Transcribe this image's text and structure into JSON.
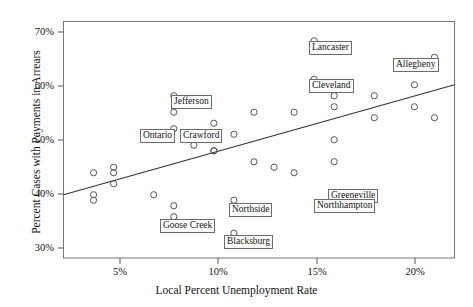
{
  "chart_data": {
    "type": "scatter",
    "title": "",
    "xlabel": "Local Percent Unemployment Rate",
    "ylabel": "Percent Cases with Payments in Arrears",
    "xlim": [
      2.5,
      22.0
    ],
    "ylim": [
      28.5,
      71.5
    ],
    "grid": false,
    "legend": "none",
    "x_ticks": [
      {
        "value": 5,
        "label": "5%"
      },
      {
        "value": 10,
        "label": "10%"
      },
      {
        "value": 15,
        "label": "15%"
      },
      {
        "value": 20,
        "label": "20%"
      }
    ],
    "y_ticks": [
      {
        "value": 30,
        "label": "30%"
      },
      {
        "value": 40,
        "label": "40%"
      },
      {
        "value": 50,
        "label": "50%"
      },
      {
        "value": 60,
        "label": "60%"
      },
      {
        "value": 70,
        "label": "70%"
      }
    ],
    "marker": "open-circle",
    "marker_color": "#555555",
    "points": [
      {
        "x": 4.0,
        "y": 44.0,
        "label": ""
      },
      {
        "x": 4.0,
        "y": 40.0,
        "label": ""
      },
      {
        "x": 4.0,
        "y": 39.0,
        "label": ""
      },
      {
        "x": 5.0,
        "y": 45.0,
        "label": ""
      },
      {
        "x": 5.0,
        "y": 44.0,
        "label": ""
      },
      {
        "x": 5.0,
        "y": 42.0,
        "label": ""
      },
      {
        "x": 7.0,
        "y": 40.0,
        "label": ""
      },
      {
        "x": 8.0,
        "y": 58.0,
        "label": "Jefferson"
      },
      {
        "x": 8.0,
        "y": 55.0,
        "label": ""
      },
      {
        "x": 8.0,
        "y": 52.0,
        "label": "Crawford"
      },
      {
        "x": 8.0,
        "y": 38.0,
        "label": "Goose Creek"
      },
      {
        "x": 8.0,
        "y": 36.0,
        "label": ""
      },
      {
        "x": 9.0,
        "y": 49.0,
        "label": ""
      },
      {
        "x": 10.0,
        "y": 53.0,
        "label": ""
      },
      {
        "x": 10.0,
        "y": 50.0,
        "label": ""
      },
      {
        "x": 10.0,
        "y": 48.0,
        "label": ""
      },
      {
        "x": 10.0,
        "y": 48.0,
        "label": ""
      },
      {
        "x": 11.0,
        "y": 51.0,
        "label": ""
      },
      {
        "x": 11.0,
        "y": 39.0,
        "label": "Northside"
      },
      {
        "x": 11.0,
        "y": 33.0,
        "label": "Blacksburg"
      },
      {
        "x": 12.0,
        "y": 55.0,
        "label": ""
      },
      {
        "x": 12.0,
        "y": 46.0,
        "label": ""
      },
      {
        "x": 13.0,
        "y": 45.0,
        "label": ""
      },
      {
        "x": 14.0,
        "y": 55.0,
        "label": ""
      },
      {
        "x": 14.0,
        "y": 44.0,
        "label": ""
      },
      {
        "x": 15.0,
        "y": 68.0,
        "label": "Lancaster"
      },
      {
        "x": 15.0,
        "y": 61.0,
        "label": "Cleveland"
      },
      {
        "x": 16.0,
        "y": 58.0,
        "label": ""
      },
      {
        "x": 16.0,
        "y": 56.0,
        "label": ""
      },
      {
        "x": 16.0,
        "y": 50.0,
        "label": ""
      },
      {
        "x": 16.0,
        "y": 46.0,
        "label": "Greeneville"
      },
      {
        "x": 16.0,
        "y": 40.0,
        "label": "Northhampton"
      },
      {
        "x": 18.0,
        "y": 58.0,
        "label": ""
      },
      {
        "x": 18.0,
        "y": 54.0,
        "label": ""
      },
      {
        "x": 20.0,
        "y": 60.0,
        "label": ""
      },
      {
        "x": 20.0,
        "y": 56.0,
        "label": ""
      },
      {
        "x": 21.0,
        "y": 65.0,
        "label": "Allegheny"
      },
      {
        "x": 21.0,
        "y": 54.0,
        "label": ""
      }
    ],
    "trend_line": {
      "type": "line",
      "color": "#333333",
      "x_start": 2.5,
      "y_start": 40.0,
      "x_end": 22.0,
      "y_end": 60.0
    },
    "labels": [
      {
        "text": "Lancaster",
        "x": 15.0,
        "y": 68.0
      },
      {
        "text": "Allegheny",
        "x": 21.0,
        "y": 65.0
      },
      {
        "text": "Cleveland",
        "x": 15.0,
        "y": 61.0
      },
      {
        "text": "Jefferson",
        "x": 8.0,
        "y": 58.0
      },
      {
        "text": "Ontario",
        "x": 8.0,
        "y": 52.0
      },
      {
        "text": "Crawford",
        "x": 8.0,
        "y": 52.0
      },
      {
        "text": "Greeneville",
        "x": 16.0,
        "y": 46.0
      },
      {
        "text": "Northhampton",
        "x": 16.0,
        "y": 40.0
      },
      {
        "text": "Northside",
        "x": 11.0,
        "y": 39.0
      },
      {
        "text": "Goose Creek",
        "x": 8.0,
        "y": 36.0
      },
      {
        "text": "Blacksburg",
        "x": 11.0,
        "y": 33.0
      }
    ]
  },
  "axes": {
    "x_title": "Local Percent Unemployment Rate",
    "y_title": "Percent Cases with Payments in Arrears",
    "x_tick_labels": [
      "5%",
      "10%",
      "15%",
      "20%"
    ],
    "y_tick_labels": [
      "70%",
      "60%",
      "50%",
      "40%",
      "30%"
    ]
  },
  "labels_text": {
    "lancaster": "Lancaster",
    "allegheny": "Allegheny",
    "cleveland": "Cleveland",
    "jefferson": "Jefferson",
    "ontario": "Ontario",
    "crawford": "Crawford",
    "greeneville": "Greeneville",
    "northhampton": "Northhampton",
    "northside": "Northside",
    "goose_creek": "Goose Creek",
    "blacksburg": "Blacksburg"
  },
  "colors": {
    "frame": "#777777",
    "marker": "#555555",
    "trend": "#333333",
    "text": "#111111",
    "label_border": "#6b6b6b",
    "background": "#ffffff"
  }
}
